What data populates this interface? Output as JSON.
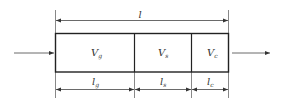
{
  "diagram": {
    "total_length_label": "l",
    "segments": [
      {
        "volume_label": "V",
        "volume_sub": "g",
        "length_label": "l",
        "length_sub": "g"
      },
      {
        "volume_label": "V",
        "volume_sub": "s",
        "length_label": "l",
        "length_sub": "s"
      },
      {
        "volume_label": "V",
        "volume_sub": "c",
        "length_label": "l",
        "length_sub": "c"
      }
    ],
    "colors": {
      "stroke": "#333333",
      "background": "#ffffff"
    }
  }
}
